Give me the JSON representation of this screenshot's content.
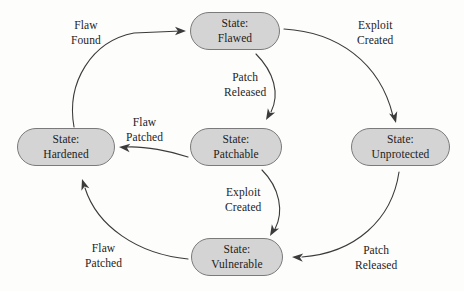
{
  "diagram": {
    "colors": {
      "node_fill": "#d4d4d4",
      "node_border": "#7a7a7a",
      "text": "#1c1c1c",
      "edge_stroke": "#3b3b3b",
      "background": "#fdfdfc"
    },
    "nodes": [
      {
        "id": "flawed",
        "prefix": "State:",
        "name": "Flawed",
        "x": 190,
        "y": 12,
        "w": 90,
        "h": 38
      },
      {
        "id": "hardened",
        "prefix": "State:",
        "name": "Hardened",
        "x": 17,
        "y": 128,
        "w": 98,
        "h": 38
      },
      {
        "id": "patchable",
        "prefix": "State:",
        "name": "Patchable",
        "x": 190,
        "y": 128,
        "w": 92,
        "h": 38
      },
      {
        "id": "unprotected",
        "prefix": "State:",
        "name": "Unprotected",
        "x": 351,
        "y": 128,
        "w": 99,
        "h": 38
      },
      {
        "id": "vulnerable",
        "prefix": "State:",
        "name": "Vulnerable",
        "x": 191,
        "y": 238,
        "w": 92,
        "h": 38
      }
    ],
    "edges": [
      {
        "id": "hardened-to-flawed",
        "from": "hardened",
        "to": "flawed",
        "line1": "Flaw",
        "line2": "Found",
        "label_x": 71,
        "label_y": 18,
        "path": "M 74 127 C 66 82 92 41 134 33 L 181 31",
        "arrow_x": 186,
        "arrow_y": 31,
        "arrow_angle": 0
      },
      {
        "id": "flawed-to-unprotected",
        "from": "flawed",
        "to": "unprotected",
        "line1": "Exploit",
        "line2": "Created",
        "label_x": 357,
        "label_y": 18,
        "path": "M 284 29 C 337 32 380 62 393 116",
        "arrow_x": 396,
        "arrow_y": 123,
        "arrow_angle": 75
      },
      {
        "id": "flawed-to-patchable",
        "from": "flawed",
        "to": "patchable",
        "line1": "Patch",
        "line2": "Released",
        "label_x": 224,
        "label_y": 70,
        "path": "M 256 54 C 274 72 280 94 271 112",
        "arrow_x": 266,
        "arrow_y": 120,
        "arrow_angle": 120
      },
      {
        "id": "patchable-to-hardened",
        "from": "patchable",
        "to": "hardened",
        "line1": "Flaw",
        "line2": "Patched",
        "label_x": 126,
        "label_y": 115,
        "path": "M 188 157 C 170 151 145 146 126 147",
        "arrow_x": 119,
        "arrow_y": 147,
        "arrow_angle": 185
      },
      {
        "id": "patchable-to-vulnerable",
        "from": "patchable",
        "to": "vulnerable",
        "line1": "Exploit",
        "line2": "Created",
        "label_x": 225,
        "label_y": 185,
        "path": "M 262 170 C 280 188 284 212 275 229",
        "arrow_x": 270,
        "arrow_y": 236,
        "arrow_angle": 120
      },
      {
        "id": "unprotected-to-vulnerable",
        "from": "unprotected",
        "to": "vulnerable",
        "line1": "Patch",
        "line2": "Released",
        "label_x": 355,
        "label_y": 243,
        "path": "M 399 172 C 392 220 355 253 302 257",
        "arrow_x": 292,
        "arrow_y": 257,
        "arrow_angle": 183
      },
      {
        "id": "vulnerable-to-hardened",
        "from": "vulnerable",
        "to": "hardened",
        "line1": "Flaw",
        "line2": "Patched",
        "label_x": 85,
        "label_y": 241,
        "path": "M 188 259 C 137 254 97 226 85 188",
        "arrow_x": 82,
        "arrow_y": 179,
        "arrow_angle": 252
      }
    ]
  }
}
